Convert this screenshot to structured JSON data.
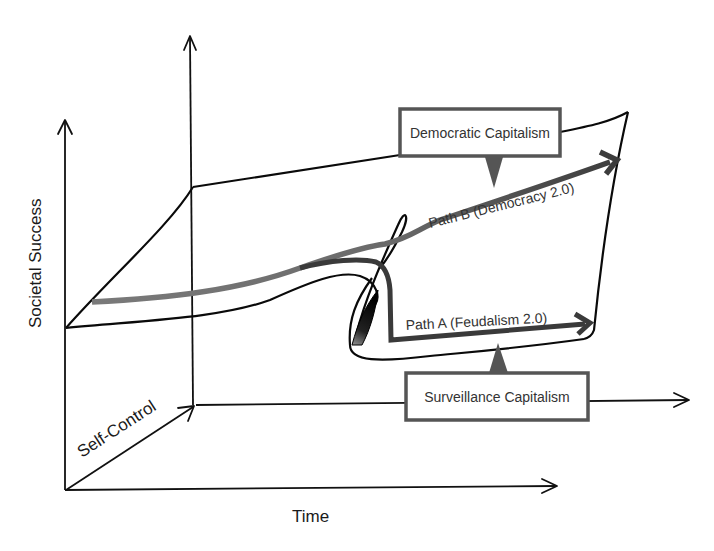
{
  "diagram": {
    "axes": {
      "vertical_label": "Societal Success",
      "horizontal_label": "Time",
      "depth_label": "Self-Control"
    },
    "states": {
      "upper": {
        "label": "Democratic Capitalism"
      },
      "lower": {
        "label": "Surveillance Capitalism"
      }
    },
    "paths": {
      "path_b": {
        "label": "Path B (Democracy 2.0)"
      },
      "path_a": {
        "label": "Path A (Feudalism 2.0)"
      }
    },
    "colors": {
      "surface_stroke": "#0a0a0a",
      "path_dark": "#3a3a3a",
      "path_mid": "#6e6e6e",
      "box_border": "#555555"
    }
  }
}
